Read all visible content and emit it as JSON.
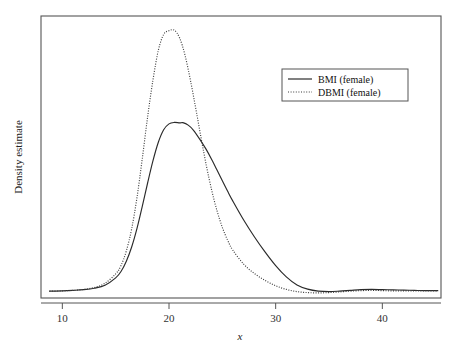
{
  "chart_data": {
    "type": "line",
    "title": "",
    "subtitle": "",
    "xlabel": "x",
    "ylabel": "Density estimate",
    "xlim": [
      8.0,
      45.5
    ],
    "ylim": [
      0,
      0.115
    ],
    "grid": false,
    "xticks": [
      10,
      20,
      30,
      40
    ],
    "xticklabels": [
      "10",
      "20",
      "30",
      "40"
    ],
    "yticks": [],
    "yticklabels": [],
    "legend": {
      "position": "upper-right",
      "entries": [
        {
          "name": "BMI (female)",
          "style": "solid",
          "color": "#2a2a2a"
        },
        {
          "name": "DBMI (female)",
          "style": "dotted",
          "color": "#2a2a2a"
        }
      ]
    },
    "series": [
      {
        "name": "BMI (female)",
        "style": "solid",
        "color": "#2a2a2a",
        "peak_x": 21.3,
        "peak_y": 0.0715,
        "x": [
          8.8,
          10,
          11,
          12,
          13,
          14,
          15,
          15.5,
          16,
          16.5,
          17,
          17.5,
          18,
          18.5,
          19,
          19.5,
          20,
          20.5,
          21,
          21.3,
          21.8,
          22.3,
          23,
          23.5,
          24,
          24.5,
          25,
          25.5,
          26,
          27,
          28,
          29,
          30,
          31,
          32,
          33,
          34,
          35,
          36,
          37,
          38,
          39,
          40,
          41,
          42,
          43,
          44,
          45.2
        ],
        "y": [
          0.0028,
          0.0029,
          0.0031,
          0.0034,
          0.004,
          0.0052,
          0.0082,
          0.0108,
          0.015,
          0.0208,
          0.0284,
          0.0375,
          0.047,
          0.056,
          0.0635,
          0.0686,
          0.071,
          0.0716,
          0.0714,
          0.0715,
          0.0705,
          0.0684,
          0.064,
          0.0605,
          0.0565,
          0.0522,
          0.0478,
          0.0435,
          0.0394,
          0.0318,
          0.025,
          0.0188,
          0.0132,
          0.0086,
          0.0053,
          0.0036,
          0.0028,
          0.0026,
          0.0028,
          0.0031,
          0.0034,
          0.0035,
          0.0034,
          0.0033,
          0.0032,
          0.0031,
          0.003,
          0.003
        ]
      },
      {
        "name": "DBMI (female)",
        "style": "dotted",
        "color": "#3a3a3a",
        "peak_x": 20.5,
        "peak_y": 0.109,
        "x": [
          8.8,
          10,
          11,
          12,
          13,
          14,
          15,
          15.5,
          16,
          16.5,
          17,
          17.5,
          18,
          18.5,
          19,
          19.5,
          20,
          20.5,
          21,
          21.5,
          22,
          22.5,
          23,
          23.5,
          24,
          24.5,
          25,
          25.5,
          26,
          27,
          28,
          29,
          30,
          31,
          32,
          33,
          34,
          35,
          36,
          37,
          38,
          39,
          40,
          41,
          42,
          43,
          44,
          45.2
        ],
        "y": [
          0.0028,
          0.0029,
          0.0031,
          0.0035,
          0.0043,
          0.006,
          0.0098,
          0.0132,
          0.0192,
          0.0282,
          0.041,
          0.057,
          0.074,
          0.089,
          0.101,
          0.1075,
          0.109,
          0.1092,
          0.106,
          0.099,
          0.089,
          0.0775,
          0.0655,
          0.054,
          0.044,
          0.0356,
          0.0288,
          0.0235,
          0.0194,
          0.0138,
          0.01,
          0.0072,
          0.005,
          0.0035,
          0.0026,
          0.0022,
          0.0021,
          0.0022,
          0.0025,
          0.0028,
          0.003,
          0.0031,
          0.003,
          0.0029,
          0.0029,
          0.0029,
          0.0029,
          0.0029
        ]
      }
    ]
  },
  "figure": {
    "frame_color": "#555555",
    "axis_color": "#555555",
    "background": "#ffffff",
    "tick_label_color": "#333333"
  }
}
